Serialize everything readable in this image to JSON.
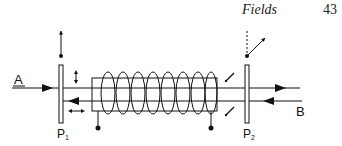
{
  "header": {
    "running_title": "Fields",
    "page_number": "43"
  },
  "diagram": {
    "beam_left_label": "A",
    "beam_right_label": "B",
    "polarizer_left_label": "P",
    "polarizer_left_subscript": "1",
    "polarizer_right_label": "P",
    "polarizer_right_subscript": "2",
    "coil_turns": 8,
    "colors": {
      "ink": "#111111",
      "background": "#ffffff"
    }
  }
}
